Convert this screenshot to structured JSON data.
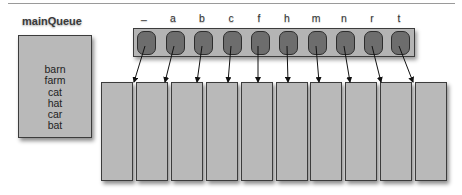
{
  "main_queue": {
    "label": "mainQueue",
    "items": [
      "barn",
      "farm",
      "cat",
      "hat",
      "car",
      "bat"
    ]
  },
  "buckets": {
    "labels": [
      "_",
      "a",
      "b",
      "c",
      "f",
      "h",
      "m",
      "n",
      "r",
      "t"
    ],
    "count": 10
  },
  "colors": {
    "box_fill": "#b9b9b9",
    "cell_fill": "#6d6d6d",
    "border": "#3c3c3c"
  }
}
